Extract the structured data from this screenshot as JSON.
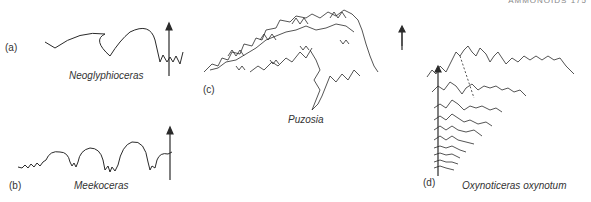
{
  "header": {
    "running_title": "AMMONOIDS   175"
  },
  "panels": [
    {
      "id": "a",
      "label": "(a)",
      "species": "Neoglyphioceras"
    },
    {
      "id": "b",
      "label": "(b)",
      "species": "Meekoceras"
    },
    {
      "id": "c",
      "label": "(c)",
      "species": "Puzosia"
    },
    {
      "id": "d",
      "label": "(d)",
      "species": "Oxynoticeras oxynotum"
    }
  ],
  "colors": {
    "line": "#2a2a2a",
    "background": "#ffffff"
  }
}
